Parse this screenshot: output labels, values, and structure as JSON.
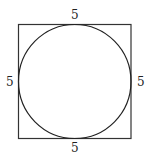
{
  "diagram": {
    "type": "circle-inscribed-in-square",
    "shapes": {
      "square": {
        "x": 18.5,
        "y": 24.5,
        "width": 112.5,
        "height": 114,
        "stroke": "#333333",
        "stroke_width": 1.2
      },
      "circle": {
        "cx": 74.75,
        "cy": 81.5,
        "rx": 56.25,
        "ry": 57,
        "stroke": "#222222",
        "stroke_width": 1.2
      }
    },
    "labels": {
      "top": "5",
      "bottom": "5",
      "left": "5",
      "right": "5"
    }
  }
}
